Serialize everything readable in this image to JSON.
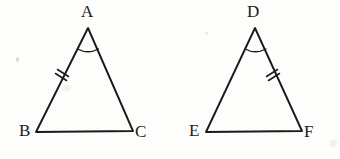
{
  "figure": {
    "background_color": "#fdfdfb",
    "stroke_color": "#1a1a1a",
    "label_color": "#1a1a1a",
    "triangles": [
      {
        "name": "triangle-abc",
        "vertices": {
          "apex": {
            "label": "A",
            "x": 88,
            "y": 28
          },
          "left": {
            "label": "B",
            "x": 36,
            "y": 132
          },
          "right": {
            "label": "C",
            "x": 133,
            "y": 131
          }
        },
        "angle_arc": {
          "at": "A",
          "count": 1
        },
        "tick_marks": {
          "on_side": "AB",
          "count": 2
        }
      },
      {
        "name": "triangle-def",
        "vertices": {
          "apex": {
            "label": "D",
            "x": 255,
            "y": 28
          },
          "left": {
            "label": "E",
            "x": 206,
            "y": 132
          },
          "right": {
            "label": "F",
            "x": 302,
            "y": 131
          }
        },
        "angle_arc": {
          "at": "D",
          "count": 1
        },
        "tick_marks": {
          "on_side": "DF",
          "count": 2
        }
      }
    ],
    "labels": {
      "a": "A",
      "b": "B",
      "c": "C",
      "d": "D",
      "e": "E",
      "f": "F"
    }
  }
}
